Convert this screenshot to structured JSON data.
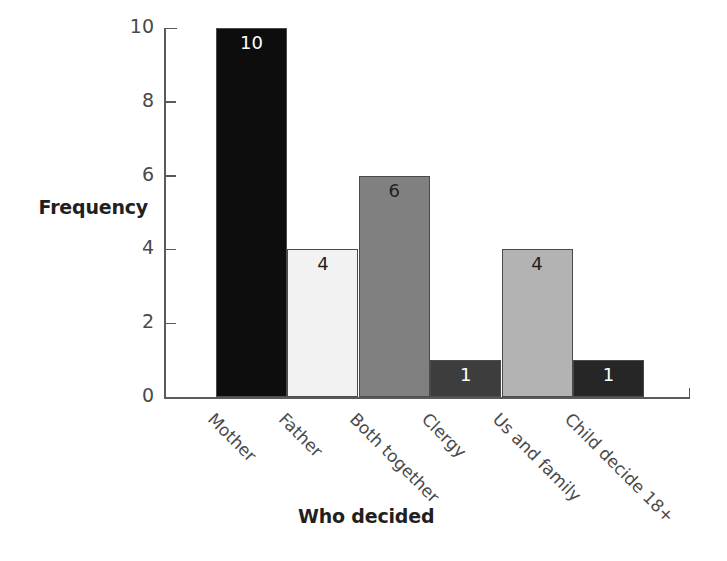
{
  "chart_data": {
    "type": "bar",
    "title": "",
    "xlabel": "Who decided",
    "ylabel": "Frequency",
    "categories": [
      "Mother",
      "Father",
      "Both together",
      "Clergy",
      "Us and family",
      "Child decide 18+"
    ],
    "values": [
      10,
      4,
      6,
      1,
      4,
      1
    ],
    "value_labels": [
      "10",
      "4",
      "6",
      "1",
      "4",
      "1"
    ],
    "ylim": [
      0,
      10
    ],
    "y_ticks": [
      "0",
      "2",
      "4",
      "6",
      "8",
      "10"
    ],
    "y_tick_values": [
      0,
      2,
      4,
      6,
      8,
      10
    ],
    "grid": false,
    "legend": "none",
    "bar_colors": [
      "#0d0d0d",
      "#f2f2f2",
      "#808080",
      "#3d3d3d",
      "#b3b3b3",
      "#262626"
    ],
    "bar_label_colors": [
      "#ffffff",
      "#231f20",
      "#231f20",
      "#ffffff",
      "#231f20",
      "#ffffff"
    ],
    "bar_border_color": "#4a4a4a",
    "axis_color": "#5a5a5a",
    "text_color": "#4a4a4a",
    "title_color": "#231f20",
    "background": "#ffffff",
    "x_label_rotation_deg": 45
  }
}
